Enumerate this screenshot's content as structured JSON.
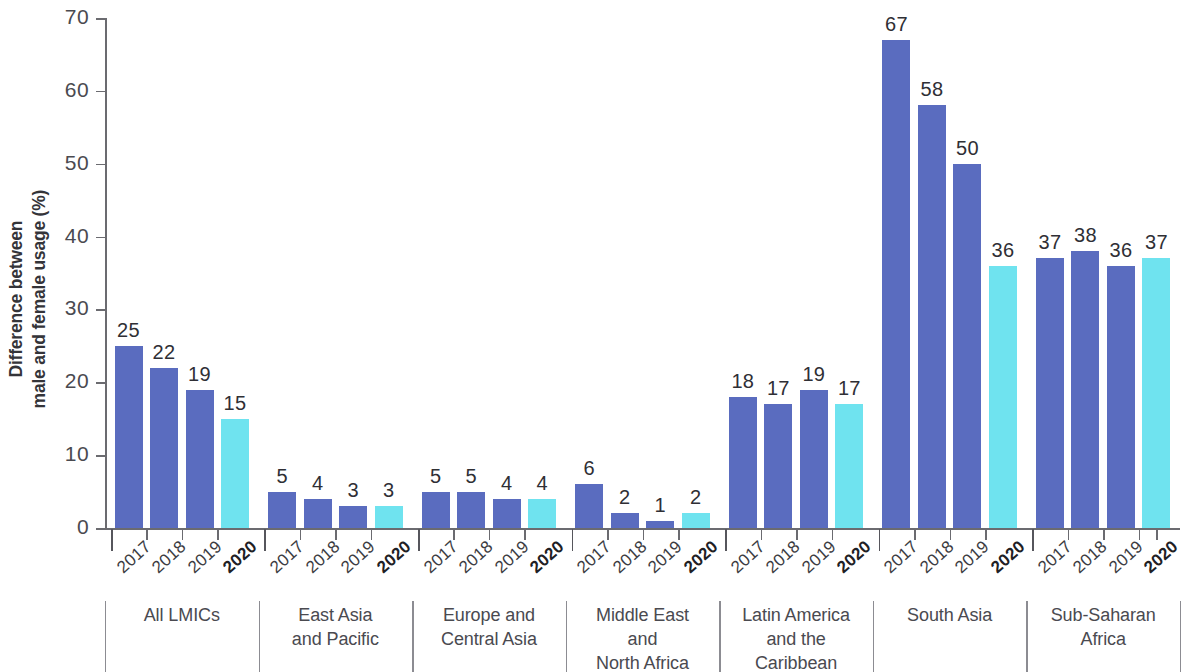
{
  "chart_data": {
    "type": "bar",
    "title": "",
    "subtitle": "",
    "xlabel": "",
    "ylabel": "Difference between male and female usage (%)",
    "ylabel_lines": [
      "Difference between",
      "male and female usage (%)"
    ],
    "ylim": [
      0,
      70
    ],
    "ytick_values": [
      0,
      10,
      20,
      30,
      40,
      50,
      60,
      70
    ],
    "ytick_labels": [
      "0",
      "10",
      "20",
      "30",
      "40",
      "50",
      "60",
      "70"
    ],
    "grid": false,
    "legend": "none",
    "categories": [
      "2017",
      "2018",
      "2019",
      "2020"
    ],
    "highlight_category": "2020",
    "colors": {
      "bar_default": "#5a6cbf",
      "bar_highlight": "#6fe3ef",
      "axis": "#6b6b70",
      "text": "#3b3b40"
    },
    "groups": [
      {
        "name": "All LMICs",
        "name_lines": [
          "All LMICs"
        ],
        "values": [
          25,
          22,
          19,
          15
        ],
        "labels": [
          "25",
          "22",
          "19",
          "15"
        ]
      },
      {
        "name": "East Asia and Pacific",
        "name_lines": [
          "East Asia",
          "and Pacific"
        ],
        "values": [
          5,
          4,
          3,
          3
        ],
        "labels": [
          "5",
          "4",
          "3",
          "3"
        ]
      },
      {
        "name": "Europe and Central Asia",
        "name_lines": [
          "Europe and",
          "Central Asia"
        ],
        "values": [
          5,
          5,
          4,
          4
        ],
        "labels": [
          "5",
          "5",
          "4",
          "4"
        ]
      },
      {
        "name": "Middle East and North Africa",
        "name_lines": [
          "Middle East",
          "and",
          "North Africa"
        ],
        "values": [
          6,
          2,
          1,
          2
        ],
        "labels": [
          "6",
          "2",
          "1",
          "2"
        ]
      },
      {
        "name": "Latin America and the Caribbean",
        "name_lines": [
          "Latin America",
          "and the",
          "Caribbean"
        ],
        "values": [
          18,
          17,
          19,
          17
        ],
        "labels": [
          "18",
          "17",
          "19",
          "17"
        ]
      },
      {
        "name": "South Asia",
        "name_lines": [
          "South Asia"
        ],
        "values": [
          67,
          58,
          50,
          36
        ],
        "labels": [
          "67",
          "58",
          "50",
          "36"
        ]
      },
      {
        "name": "Sub-Saharan Africa",
        "name_lines": [
          "Sub-Saharan",
          "Africa"
        ],
        "values": [
          37,
          38,
          36,
          37
        ],
        "labels": [
          "37",
          "38",
          "36",
          "37"
        ]
      }
    ]
  }
}
